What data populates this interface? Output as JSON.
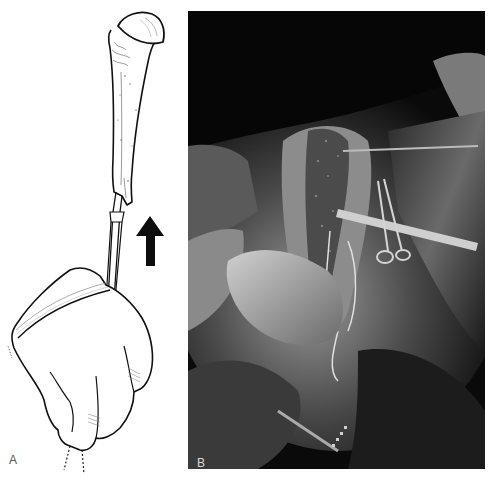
{
  "figure": {
    "panels": [
      {
        "id": "A",
        "label": "A",
        "kind": "line-illustration",
        "description": "Gloved hand pushing a rod instrument upward into the medullary canal of a humerus",
        "elements": [
          "humerus-bone",
          "humeral-head",
          "rod-instrument",
          "gloved-hand",
          "upward-arrow"
        ],
        "arrow_direction": "up"
      },
      {
        "id": "B",
        "label": "B",
        "kind": "surgical-photograph",
        "description": "Intraoperative grayscale photo of exposed humerus with retractors, clamps and surgical drapes",
        "elements": [
          "surgical-field",
          "bone-exposure",
          "retractor",
          "ring-clamps",
          "surgeon-gloved-hand",
          "drapes"
        ]
      }
    ],
    "colors": {
      "ink": "#111111",
      "paper": "#ffffff",
      "photo_bg": "#0a0a0a",
      "label_a": "#555555",
      "label_b": "#d8d8d8"
    }
  }
}
